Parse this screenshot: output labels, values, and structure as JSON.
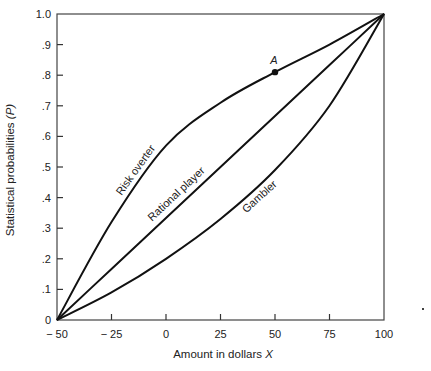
{
  "chart_data": {
    "type": "line",
    "title": "",
    "xlabel": "Amount in dollars",
    "xlabel_var": "X",
    "ylabel": "Statistical probabilities",
    "ylabel_var": "(P)",
    "xlim": [
      -50,
      100
    ],
    "ylim": [
      0,
      1.0
    ],
    "grid": false,
    "legend": "none (curves labeled inline)",
    "x_ticks": [
      -50,
      -25,
      0,
      25,
      50,
      75,
      100
    ],
    "x_tick_labels": [
      "− 50",
      "− 25",
      "0",
      "25",
      "50",
      "75",
      "100"
    ],
    "y_ticks": [
      0,
      0.1,
      0.2,
      0.3,
      0.4,
      0.5,
      0.6,
      0.7,
      0.8,
      0.9,
      1.0
    ],
    "y_tick_labels": [
      "0",
      ".1",
      ".2",
      ".3",
      ".4",
      ".5",
      ".6",
      ".7",
      ".8",
      ".9",
      "1.0"
    ],
    "x": [
      -50,
      -25,
      0,
      25,
      50,
      75,
      100
    ],
    "series": [
      {
        "name": "Risk overter",
        "values": [
          0,
          0.32,
          0.57,
          0.71,
          0.81,
          0.9,
          1.0
        ]
      },
      {
        "name": "Rational player",
        "values": [
          0,
          0.167,
          0.333,
          0.5,
          0.667,
          0.833,
          1.0
        ]
      },
      {
        "name": "Gambler",
        "values": [
          0,
          0.09,
          0.2,
          0.33,
          0.49,
          0.7,
          1.0
        ]
      }
    ],
    "annotations": [
      {
        "label": "A",
        "x": 50,
        "y": 0.81,
        "series": "Risk overter",
        "marker": "filled-circle"
      }
    ]
  }
}
